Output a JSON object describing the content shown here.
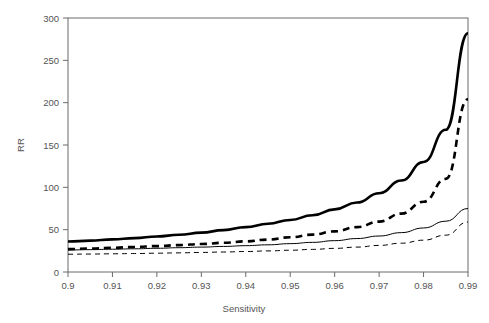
{
  "chart_data": {
    "type": "line",
    "title": "",
    "subtitle": "",
    "xlabel": "Sensitivity",
    "ylabel": "RR",
    "xlim": [
      0.9,
      0.99
    ],
    "ylim": [
      0,
      300
    ],
    "grid": false,
    "legend": "none",
    "frame": "box",
    "xticks": [
      0.9,
      0.91,
      0.92,
      0.93,
      0.94,
      0.95,
      0.96,
      0.97,
      0.98,
      0.99
    ],
    "xticklabels": [
      "0.9",
      "0.91",
      "0.92",
      "0.93",
      "0.94",
      "0.95",
      "0.96",
      "0.97",
      "0.98",
      "0.99"
    ],
    "yticks": [
      0,
      50,
      100,
      150,
      200,
      250,
      300
    ],
    "yticklabels": [
      "0",
      "50",
      "100",
      "150",
      "200",
      "250",
      "300"
    ],
    "x": [
      0.9,
      0.905,
      0.91,
      0.915,
      0.92,
      0.925,
      0.93,
      0.935,
      0.94,
      0.945,
      0.95,
      0.955,
      0.96,
      0.965,
      0.97,
      0.975,
      0.98,
      0.985,
      0.99
    ],
    "series": [
      {
        "name": "thick-solid",
        "style": "solid",
        "width": "thick",
        "color": "#000000",
        "values": [
          36,
          37,
          38.5,
          40,
          42,
          44,
          46.5,
          49.5,
          53,
          57,
          61.5,
          67,
          74,
          82,
          93,
          108,
          130,
          168,
          282
        ]
      },
      {
        "name": "thick-dashed",
        "style": "dashed",
        "width": "thick",
        "color": "#000000",
        "values": [
          27,
          27.8,
          28.6,
          29.6,
          30.6,
          31.8,
          33,
          34.5,
          36.2,
          38.3,
          41,
          44.2,
          48,
          53,
          59.5,
          69,
          83,
          110,
          204
        ]
      },
      {
        "name": "thin-solid",
        "style": "solid",
        "width": "thin",
        "color": "#000000",
        "values": [
          26,
          26.4,
          26.9,
          27.4,
          28,
          28.7,
          29.4,
          30.2,
          31.1,
          32.1,
          33.5,
          35,
          37,
          39.5,
          42.5,
          46.5,
          52,
          60,
          75
        ]
      },
      {
        "name": "thin-dashed",
        "style": "dashed",
        "width": "thin",
        "color": "#000000",
        "values": [
          21,
          21.2,
          21.5,
          21.8,
          22.2,
          22.6,
          23.1,
          23.6,
          24.2,
          24.9,
          25.7,
          26.7,
          27.9,
          29.4,
          31.4,
          34,
          37.6,
          43.5,
          59
        ]
      }
    ]
  }
}
